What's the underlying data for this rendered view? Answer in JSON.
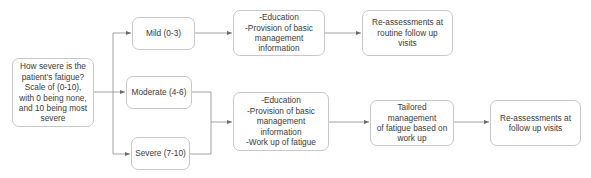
{
  "diagram": {
    "type": "flowchart",
    "colors": {
      "box_border": "#c8c8c8",
      "line": "#8a8a8a",
      "text": "#3a3a3a",
      "background": "#ffffff"
    },
    "nodes": {
      "question": {
        "text": "How severe is the\npatient's fatigue?\nScale of (0-10),\nwith 0 being none,\nand 10 being most\nsevere"
      },
      "mild": {
        "text": "Mild (0-3)"
      },
      "moderate": {
        "text": "Moderate (4-6)"
      },
      "severe": {
        "text": "Severe (7-10)"
      },
      "mild_action": {
        "text": "-Education\n-Provision of basic\nmanagement\ninformation"
      },
      "mild_followup": {
        "text": "Re-assessments at\nroutine follow up\nvisits"
      },
      "modsev_action": {
        "text": "-Education\n-Provision of basic\nmanagement\ninformation\n-Work up of fatigue"
      },
      "tailored": {
        "text": "Tailored management\nof fatigue based on\nwork up"
      },
      "modsev_followup": {
        "text": "Re-assessments at\nfollow up visits"
      }
    },
    "edges": [
      {
        "from": "question",
        "to": "mild"
      },
      {
        "from": "question",
        "to": "moderate"
      },
      {
        "from": "question",
        "to": "severe"
      },
      {
        "from": "mild",
        "to": "mild_action"
      },
      {
        "from": "mild_action",
        "to": "mild_followup"
      },
      {
        "from": "moderate",
        "to": "modsev_action"
      },
      {
        "from": "severe",
        "to": "modsev_action"
      },
      {
        "from": "modsev_action",
        "to": "tailored"
      },
      {
        "from": "tailored",
        "to": "modsev_followup"
      }
    ]
  }
}
